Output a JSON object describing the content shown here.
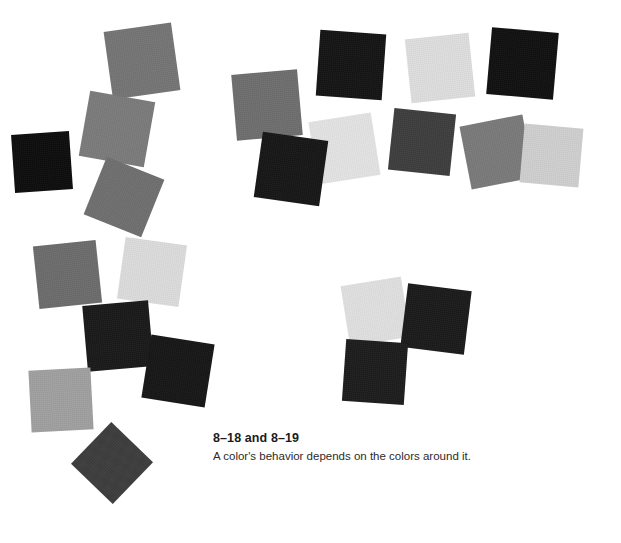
{
  "figure": {
    "caption_title": "8–18 and 8–19",
    "caption_body": "A color's behavior depends on the colors around it.",
    "background_color": "#ffffff"
  },
  "palette": {
    "near_black": "#0d0d0d",
    "black": "#151515",
    "ink_black": "#1a1a1a",
    "charcoal": "#3a3a3a",
    "dark_gray": "#4a4a4a",
    "mid_dark_gray": "#6e6e6e",
    "mid_gray": "#757575",
    "mid_gray_warm": "#7a7a7a",
    "light_mid_gray": "#a0a0a0",
    "light_gray": "#cfcfcf",
    "pale_gray": "#dcdcdc",
    "near_white_gray": "#e3e3e3"
  },
  "swatches": [
    {
      "id": "sw-01",
      "group": "left-cluster",
      "x": 108,
      "y": 27,
      "size": 68,
      "rotate": -8,
      "color": "#757575"
    },
    {
      "id": "sw-02",
      "group": "left-cluster",
      "x": 84,
      "y": 96,
      "size": 66,
      "rotate": 10,
      "color": "#7b7b7b"
    },
    {
      "id": "sw-03",
      "group": "left-cluster",
      "x": 13,
      "y": 133,
      "size": 58,
      "rotate": -4,
      "color": "#0d0d0d"
    },
    {
      "id": "sw-04",
      "group": "left-cluster",
      "x": 93,
      "y": 166,
      "size": 62,
      "rotate": 22,
      "color": "#6f6f6f"
    },
    {
      "id": "sw-05",
      "group": "left-cluster",
      "x": 36,
      "y": 243,
      "size": 63,
      "rotate": -6,
      "color": "#6c6c6c"
    },
    {
      "id": "sw-06",
      "group": "left-cluster",
      "x": 121,
      "y": 241,
      "size": 62,
      "rotate": 8,
      "color": "#dcdcdc"
    },
    {
      "id": "sw-07",
      "group": "left-cluster",
      "x": 85,
      "y": 303,
      "size": 66,
      "rotate": -5,
      "color": "#1a1a1a"
    },
    {
      "id": "sw-08",
      "group": "left-cluster",
      "x": 146,
      "y": 339,
      "size": 64,
      "rotate": 9,
      "color": "#171717"
    },
    {
      "id": "sw-09",
      "group": "left-cluster",
      "x": 30,
      "y": 369,
      "size": 62,
      "rotate": -3,
      "color": "#a0a0a0"
    },
    {
      "id": "sw-10",
      "group": "left-cluster",
      "x": 83,
      "y": 434,
      "size": 58,
      "rotate": 44,
      "color": "#3d3d3d"
    },
    {
      "id": "sw-11",
      "group": "top-cluster",
      "x": 234,
      "y": 72,
      "size": 66,
      "rotate": -5,
      "color": "#6e6e6e"
    },
    {
      "id": "sw-12",
      "group": "top-cluster",
      "x": 318,
      "y": 32,
      "size": 66,
      "rotate": 4,
      "color": "#151515"
    },
    {
      "id": "sw-13",
      "group": "top-cluster",
      "x": 408,
      "y": 36,
      "size": 64,
      "rotate": -6,
      "color": "#dedede"
    },
    {
      "id": "sw-14",
      "group": "top-cluster",
      "x": 489,
      "y": 30,
      "size": 67,
      "rotate": 5,
      "color": "#111111"
    },
    {
      "id": "sw-15",
      "group": "top-cluster",
      "x": 313,
      "y": 117,
      "size": 63,
      "rotate": -9,
      "color": "#e3e3e3"
    },
    {
      "id": "sw-16",
      "group": "top-cluster",
      "x": 391,
      "y": 111,
      "size": 62,
      "rotate": 6,
      "color": "#3e3e3e"
    },
    {
      "id": "sw-17",
      "group": "top-cluster",
      "x": 258,
      "y": 136,
      "size": 66,
      "rotate": 8,
      "color": "#171717"
    },
    {
      "id": "sw-18",
      "group": "top-cluster",
      "x": 465,
      "y": 120,
      "size": 64,
      "rotate": -11,
      "color": "#7a7a7a"
    },
    {
      "id": "sw-19",
      "group": "top-cluster",
      "x": 522,
      "y": 126,
      "size": 59,
      "rotate": 5,
      "color": "#cfcfcf"
    },
    {
      "id": "sw-20",
      "group": "bottom-cluster",
      "x": 345,
      "y": 281,
      "size": 61,
      "rotate": -9,
      "color": "#e0e0e0"
    },
    {
      "id": "sw-21",
      "group": "bottom-cluster",
      "x": 404,
      "y": 287,
      "size": 64,
      "rotate": 7,
      "color": "#1b1b1b"
    },
    {
      "id": "sw-22",
      "group": "bottom-cluster",
      "x": 344,
      "y": 341,
      "size": 62,
      "rotate": 4,
      "color": "#1d1d1d"
    }
  ]
}
